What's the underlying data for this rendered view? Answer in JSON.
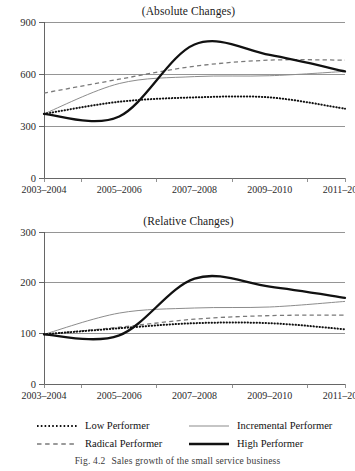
{
  "figure": {
    "caption_number": "Fig. 4.2",
    "caption_text": "Sales growth of the small service business"
  },
  "legend": {
    "position": "bottom",
    "items": [
      {
        "label": "Low Performer",
        "style": "dotted",
        "color": "#111111",
        "swatch": "dotted-line-swatch"
      },
      {
        "label": "Incremental Performer",
        "style": "solid-thin",
        "color": "#8c8c8c",
        "swatch": "thin-solid-line-swatch"
      },
      {
        "label": "Radical Performer",
        "style": "dashed",
        "color": "#7a7a7a",
        "swatch": "dashed-line-swatch"
      },
      {
        "label": "High Performer",
        "style": "solid-thick",
        "color": "#111111",
        "swatch": "thick-solid-line-swatch"
      }
    ]
  },
  "chart_data": [
    {
      "type": "line",
      "title": "(Absolute Changes)",
      "xlabel": "",
      "ylabel": "",
      "x": [
        "2003–2004",
        "2005–2006",
        "2007–2008",
        "2009–2010",
        "2011–2012"
      ],
      "categories": [
        "2003–2004",
        "2005–2006",
        "2007–2008",
        "2009–2010",
        "2011–2012"
      ],
      "xtick_labels": [
        "2003–2004",
        "2005–2006",
        "2007–2008",
        "2009–2010",
        "2011–2012"
      ],
      "ytick_labels": [
        "0",
        "300",
        "600",
        "900"
      ],
      "yticks": [
        0,
        300,
        600,
        900
      ],
      "ylim": [
        0,
        900
      ],
      "grid": "horizontal",
      "legend_position": "figure-bottom",
      "series": [
        {
          "name": "Low Performer",
          "style": "dotted",
          "color": "#111111",
          "values": [
            370,
            440,
            465,
            465,
            400
          ]
        },
        {
          "name": "Incremental Performer",
          "style": "solid-thin",
          "color": "#8c8c8c",
          "values": [
            370,
            545,
            585,
            590,
            615
          ]
        },
        {
          "name": "Radical Performer",
          "style": "dashed",
          "color": "#7a7a7a",
          "values": [
            490,
            570,
            645,
            680,
            680
          ]
        },
        {
          "name": "High Performer",
          "style": "solid-thick",
          "color": "#111111",
          "values": [
            370,
            355,
            770,
            710,
            615
          ]
        }
      ]
    },
    {
      "type": "line",
      "title": "(Relative Changes)",
      "xlabel": "",
      "ylabel": "",
      "x": [
        "2003–2004",
        "2005–2006",
        "2007–2008",
        "2009–2010",
        "2011–2012"
      ],
      "categories": [
        "2003–2004",
        "2005–2006",
        "2007–2008",
        "2009–2010",
        "2011–2012"
      ],
      "xtick_labels": [
        "2003–2004",
        "2005–2006",
        "2007–2008",
        "2009–2010",
        "2011–2012"
      ],
      "ytick_labels": [
        "0",
        "100",
        "200",
        "300"
      ],
      "yticks": [
        0,
        100,
        200,
        300
      ],
      "ylim": [
        0,
        300
      ],
      "grid": "horizontal",
      "legend_position": "figure-bottom",
      "series": [
        {
          "name": "Low Performer",
          "style": "dotted",
          "color": "#111111",
          "values": [
            98,
            110,
            120,
            120,
            108
          ]
        },
        {
          "name": "Incremental Performer",
          "style": "solid-thin",
          "color": "#8c8c8c",
          "values": [
            98,
            140,
            150,
            152,
            163
          ]
        },
        {
          "name": "Radical Performer",
          "style": "dashed",
          "color": "#7a7a7a",
          "values": [
            98,
            112,
            128,
            135,
            136
          ]
        },
        {
          "name": "High Performer",
          "style": "solid-thick",
          "color": "#111111",
          "values": [
            98,
            96,
            208,
            192,
            170
          ]
        }
      ]
    }
  ]
}
